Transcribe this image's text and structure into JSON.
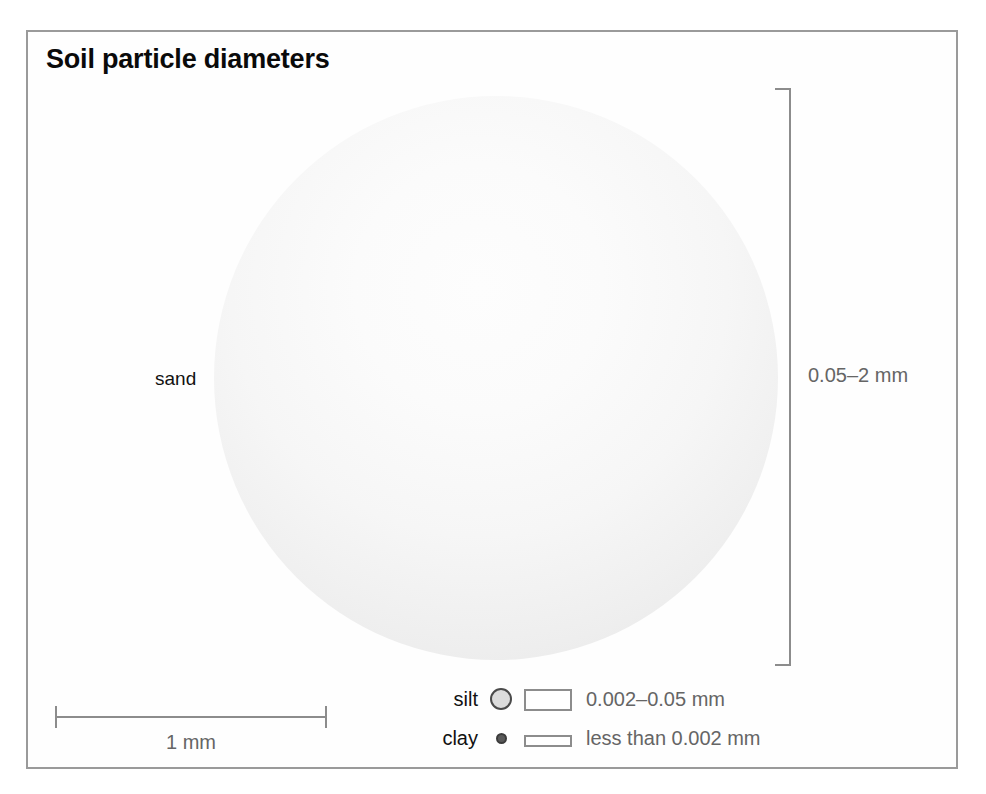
{
  "figure": {
    "title": "Soil particle diameters"
  },
  "particles": {
    "sand": {
      "label": "sand",
      "size_text": "0.05–2 mm",
      "icon": "large-circle"
    },
    "silt": {
      "label": "silt",
      "size_text": "0.002–0.05 mm",
      "icon": "medium-circle"
    },
    "clay": {
      "label": "clay",
      "size_text": "less than 0.002 mm",
      "icon": "small-dot"
    }
  },
  "scale": {
    "label": "1 mm"
  },
  "colors": {
    "frame_border": "#9a9a9a",
    "title_text": "#0a0a0a",
    "label_text": "#111111",
    "measure_text": "#656565",
    "rule": "#8c8c8c",
    "sand_fill_light": "#fdfdfd",
    "sand_fill_edge": "#e3e3e3",
    "silt_fill": "#dcdcdc",
    "silt_stroke": "#4a4a4a",
    "clay_fill": "#5a5a5a"
  },
  "chart_data": {
    "type": "bar",
    "title": "Soil particle diameters",
    "categories": [
      "sand",
      "silt",
      "clay"
    ],
    "values": [
      2,
      0.05,
      0.002
    ],
    "value_ranges": [
      [
        0.05,
        2
      ],
      [
        0.002,
        0.05
      ],
      [
        0,
        0.002
      ]
    ],
    "value_labels": [
      "0.05–2 mm",
      "0.002–0.05 mm",
      "less than 0.002 mm"
    ],
    "xlabel": "",
    "ylabel": "diameter (mm)",
    "units": "mm",
    "scale_reference": "1 mm",
    "legend": [
      "sand",
      "silt",
      "clay"
    ],
    "grid": false
  }
}
